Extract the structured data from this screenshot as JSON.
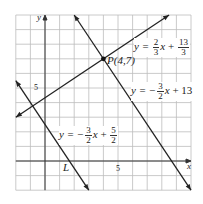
{
  "figure": {
    "grid": {
      "xmin": -2,
      "xmax": 10,
      "ymin": -2,
      "ymax": 10,
      "step": 1
    },
    "axes": {
      "x_label": "x",
      "y_label": "y",
      "x_tick_label": "5",
      "y_tick_label": "5"
    },
    "point": {
      "name": "P",
      "label": "P(4,7)",
      "x": 4,
      "y": 7
    },
    "lines": [
      {
        "id": "line-1",
        "equation": "y = 2/3 x + 13/3",
        "lhs": "y = ",
        "coef_num": "2",
        "coef_den": "3",
        "var": "x",
        "op": " + ",
        "const_num": "13",
        "const_den": "3"
      },
      {
        "id": "line-2",
        "equation": "y = -3/2 x + 13",
        "lhs": "y = −",
        "coef_num": "3",
        "coef_den": "2",
        "var": "x",
        "op": " + 13"
      },
      {
        "id": "line-L",
        "name": "L",
        "equation": "y = -3/2 x + 5/2",
        "lhs": "y = −",
        "coef_num": "3",
        "coef_den": "2",
        "var": "x",
        "op": " + ",
        "const_num": "5",
        "const_den": "2"
      }
    ]
  }
}
